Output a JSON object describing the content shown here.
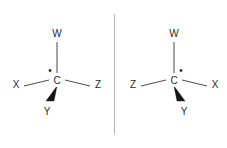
{
  "figure": {
    "background_color": "#ffffff",
    "bond_color": "#4a4a4a",
    "wedge_color": "#141414",
    "label_color": "#2b2b2b",
    "divider_color": "#b4b4b4",
    "divider": {
      "name": "mirror-plane-divider",
      "x": 114,
      "y_top": 14,
      "y_bottom": 134
    },
    "structures": [
      {
        "id": "left",
        "name": "stereocenter-left",
        "center_label": "C",
        "center_x": 57,
        "center_y": 83,
        "stereo_dot": {
          "label": "•",
          "x": 50,
          "y": 72,
          "position": "upper-left"
        },
        "substituents": [
          {
            "label": "W",
            "name": "substituent-w",
            "bond_type": "plain",
            "direction": "up",
            "label_x": 57,
            "label_y": 33,
            "bond_x1": 57,
            "bond_y1": 42,
            "bond_x2": 57,
            "bond_y2": 74
          },
          {
            "label": "X",
            "name": "substituent-x",
            "bond_type": "plain",
            "direction": "lower-left",
            "label_x": 16,
            "label_y": 85,
            "bond_x1": 24,
            "bond_y1": 86,
            "bond_x2": 49,
            "bond_y2": 80
          },
          {
            "label": "Z",
            "name": "substituent-z",
            "bond_type": "plain",
            "direction": "lower-right",
            "label_x": 98,
            "label_y": 85,
            "bond_x1": 65,
            "bond_y1": 80,
            "bond_x2": 90,
            "bond_y2": 86
          },
          {
            "label": "Y",
            "name": "substituent-y",
            "bond_type": "wedge",
            "direction": "down-left",
            "label_x": 47,
            "label_y": 113,
            "wedge_points": "57,86 46,101 54,101"
          }
        ]
      },
      {
        "id": "right",
        "name": "stereocenter-right",
        "center_label": "C",
        "center_x": 174,
        "center_y": 83,
        "stereo_dot": {
          "label": "•",
          "x": 181,
          "y": 72,
          "position": "upper-right"
        },
        "substituents": [
          {
            "label": "W",
            "name": "substituent-w",
            "bond_type": "plain",
            "direction": "up",
            "label_x": 174,
            "label_y": 33,
            "bond_x1": 174,
            "bond_y1": 42,
            "bond_x2": 174,
            "bond_y2": 74
          },
          {
            "label": "Z",
            "name": "substituent-z",
            "bond_type": "plain",
            "direction": "lower-left",
            "label_x": 133,
            "label_y": 85,
            "bond_x1": 141,
            "bond_y1": 86,
            "bond_x2": 166,
            "bond_y2": 80
          },
          {
            "label": "X",
            "name": "substituent-x",
            "bond_type": "plain",
            "direction": "lower-right",
            "label_x": 215,
            "label_y": 85,
            "bond_x1": 182,
            "bond_y1": 80,
            "bond_x2": 207,
            "bond_y2": 86
          },
          {
            "label": "Y",
            "name": "substituent-y",
            "bond_type": "wedge",
            "direction": "down-right",
            "label_x": 184,
            "label_y": 113,
            "wedge_points": "174,86 185,101 177,101"
          }
        ]
      }
    ]
  }
}
